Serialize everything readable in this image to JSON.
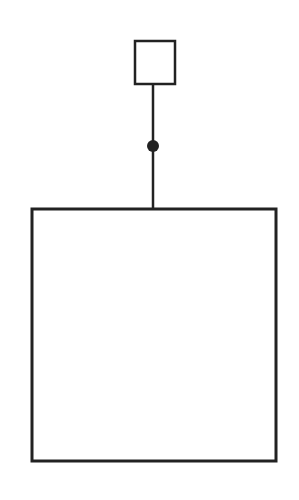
{
  "diagram": {
    "background": "#ffffff",
    "stroke_color": "#222222",
    "small_square": {
      "x": 135,
      "y": 41,
      "width": 40,
      "height": 43
    },
    "stem": {
      "x": 153,
      "y1": 84,
      "y2": 209
    },
    "node_dot": {
      "cx": 153,
      "cy": 146,
      "r": 6
    },
    "large_rect": {
      "x": 32,
      "y": 209,
      "width": 244,
      "height": 252
    }
  }
}
